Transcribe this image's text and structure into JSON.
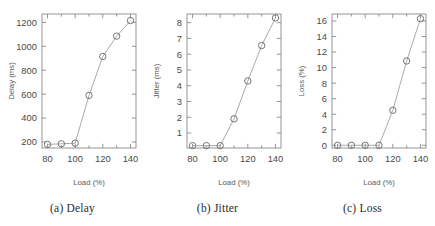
{
  "figure": {
    "panel_count": 3,
    "background_color": "#ffffff",
    "line_color": "#9a9a9a",
    "marker_color": "#6e6e6e",
    "axis_color": "#8a8a8a"
  },
  "panels": [
    {
      "caption": "(a) Delay",
      "ylabel": "Delay (ms)",
      "xlabel": "Load (%)"
    },
    {
      "caption": "(b) Jitter",
      "ylabel": "Jitter (ms)",
      "xlabel": "Load (%)"
    },
    {
      "caption": "(c) Loss",
      "ylabel": "Loss (%)",
      "xlabel": "Load (%)"
    }
  ],
  "chart_data": [
    {
      "type": "line",
      "title": "(a) Delay",
      "xlabel": "Load (%)",
      "ylabel": "Delay (ms)",
      "x": [
        80,
        90,
        100,
        110,
        120,
        130,
        140
      ],
      "values": [
        180,
        185,
        190,
        590,
        915,
        1085,
        1215
      ],
      "xlim": [
        76,
        144
      ],
      "ylim": [
        150,
        1270
      ],
      "xticks": [
        80,
        100,
        120,
        140
      ],
      "xticklabels": [
        "80",
        "100",
        "120",
        "140"
      ],
      "xminorticks": [
        90,
        110,
        130
      ],
      "yticks": [
        200,
        400,
        600,
        800,
        1000,
        1200
      ],
      "yticklabels": [
        "200",
        "400",
        "600",
        "800",
        "1000",
        "1200"
      ],
      "grid": false,
      "legend": false,
      "marker": "circle"
    },
    {
      "type": "line",
      "title": "(b) Jitter",
      "xlabel": "Load (%)",
      "ylabel": "Jitter (ms)",
      "x": [
        80,
        90,
        100,
        110,
        120,
        130,
        140
      ],
      "values": [
        0.2,
        0.2,
        0.2,
        1.9,
        4.3,
        6.55,
        8.3
      ],
      "xlim": [
        76,
        144
      ],
      "ylim": [
        0.05,
        8.55
      ],
      "xticks": [
        80,
        100,
        120,
        140
      ],
      "xticklabels": [
        "80",
        "100",
        "120",
        "140"
      ],
      "xminorticks": [
        90,
        110,
        130
      ],
      "yticks": [
        1,
        2,
        3,
        4,
        5,
        6,
        7,
        8
      ],
      "yticklabels": [
        "1",
        "2",
        "3",
        "4",
        "5",
        "6",
        "7",
        "8"
      ],
      "grid": false,
      "legend": false,
      "marker": "circle"
    },
    {
      "type": "line",
      "title": "(c) Loss",
      "xlabel": "Load (%)",
      "ylabel": "Loss (%)",
      "x": [
        80,
        90,
        100,
        110,
        120,
        130,
        140
      ],
      "values": [
        0,
        0,
        0,
        0,
        4.5,
        10.85,
        16.3
      ],
      "xlim": [
        76,
        144
      ],
      "ylim": [
        -0.35,
        16.9
      ],
      "xticks": [
        80,
        100,
        120,
        140
      ],
      "xticklabels": [
        "80",
        "100",
        "120",
        "140"
      ],
      "xminorticks": [
        90,
        110,
        130
      ],
      "yticks": [
        0,
        2,
        4,
        6,
        8,
        10,
        12,
        14,
        16
      ],
      "yticklabels": [
        "0",
        "2",
        "4",
        "6",
        "8",
        "10",
        "12",
        "14",
        "16"
      ],
      "grid": false,
      "legend": false,
      "marker": "circle"
    }
  ]
}
